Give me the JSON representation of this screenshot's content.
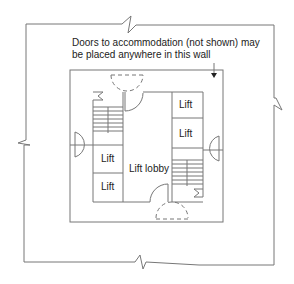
{
  "diagram": {
    "annotation": {
      "line1": "Doors to accommodation (not shown) may",
      "line2": "be placed anywhere in this wall"
    },
    "labels": {
      "lift_top_right_1": "Lift",
      "lift_top_right_2": "Lift",
      "lift_left_1": "Lift",
      "lift_left_2": "Lift",
      "lobby": "Lift lobby"
    },
    "colors": {
      "line": "#777777",
      "text": "#222222"
    }
  }
}
